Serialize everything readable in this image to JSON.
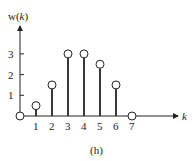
{
  "chart_data": {
    "type": "stem",
    "title": "",
    "caption": "(h)",
    "xlabel": "k",
    "ylabel": "w(k)",
    "x": [
      0,
      1,
      2,
      3,
      4,
      5,
      6,
      7
    ],
    "values": [
      0,
      0.5,
      1.5,
      3,
      3,
      2.5,
      1.5,
      0
    ],
    "xticks": [
      "1",
      "2",
      "3",
      "4",
      "5",
      "6",
      "7"
    ],
    "yticks": [
      "1",
      "2",
      "3"
    ],
    "xlim": [
      0,
      7.5
    ],
    "ylim": [
      0,
      3.8
    ],
    "grid": false,
    "legend": null
  },
  "labels": {
    "ylabel_w": "w(",
    "ylabel_k": "k",
    "ylabel_close": ")",
    "xlabel": "k",
    "caption": "(h)"
  }
}
